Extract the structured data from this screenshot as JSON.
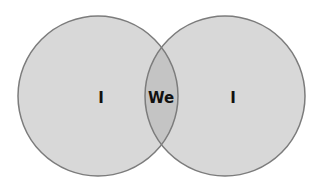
{
  "diagram": {
    "type": "venn",
    "colors": {
      "circle_fill": "#d8d8d8",
      "overlap_fill": "#c4c4c4",
      "stroke": "#7c7c7c",
      "text": "#111111"
    },
    "sets": [
      {
        "label": "I",
        "position": "left"
      },
      {
        "label": "I",
        "position": "right"
      }
    ],
    "overlap": {
      "label": "We"
    }
  }
}
